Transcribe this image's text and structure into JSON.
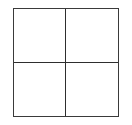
{
  "diagram": {
    "type": "grid",
    "rows": 2,
    "columns": 2,
    "line_color": "#333333",
    "background_color": "#ffffff",
    "cells": [
      {
        "row": 0,
        "col": 0,
        "label": ""
      },
      {
        "row": 0,
        "col": 1,
        "label": ""
      },
      {
        "row": 1,
        "col": 0,
        "label": ""
      },
      {
        "row": 1,
        "col": 1,
        "label": ""
      }
    ]
  }
}
